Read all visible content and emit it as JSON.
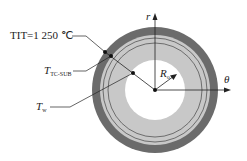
{
  "labels": {
    "tit": "TIT=1 250 ℃",
    "t_tc_sub_main": "T",
    "t_tc_sub_sub": "TC-SUB",
    "t_w_main": "T",
    "t_w_sub": "w",
    "r_axis": "r",
    "theta_axis": "θ",
    "radius_main": "R",
    "radius_sub": "o"
  },
  "colors": {
    "outer_ring": "#6b6b6b",
    "inner_ring": "#c8c8c8",
    "bore": "#ffffff",
    "lines": "#222222"
  }
}
